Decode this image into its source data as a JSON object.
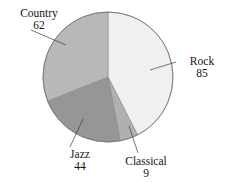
{
  "chart_data": {
    "type": "pie",
    "title": "",
    "categories": [
      "Rock",
      "Classical",
      "Jazz",
      "Country"
    ],
    "values": [
      85,
      9,
      44,
      62
    ],
    "total": 200,
    "start_angle_deg": 0,
    "direction": "clockwise",
    "legend": "none",
    "grid": false,
    "slices": [
      {
        "label": "Rock",
        "value": 85,
        "value_text": "85",
        "color": "#f0f0f0",
        "start_deg": 0.0,
        "end_deg": 153.0
      },
      {
        "label": "Classical",
        "value": 9,
        "value_text": "9",
        "color": "#b0b0b0",
        "start_deg": 153.0,
        "end_deg": 169.2
      },
      {
        "label": "Jazz",
        "value": 44,
        "value_text": "44",
        "color": "#969696",
        "start_deg": 169.2,
        "end_deg": 248.4
      },
      {
        "label": "Country",
        "value": 62,
        "value_text": "62",
        "color": "#b8b8b8",
        "start_deg": 248.4,
        "end_deg": 360.0
      }
    ],
    "colors": {
      "rock": "#f0f0f0",
      "classical": "#b0b0b0",
      "jazz": "#969696",
      "country": "#b8b8b8",
      "outline": "#6e6e6e",
      "leader_line": "#3c3c3c",
      "background": "#ffffff",
      "text": "#141414"
    },
    "geometry": {
      "cx": 108,
      "cy": 77,
      "r": 65
    }
  },
  "labels": {
    "country": {
      "name": "Country",
      "value": "62"
    },
    "rock": {
      "name": "Rock",
      "value": "85"
    },
    "jazz": {
      "name": "Jazz",
      "value": "44"
    },
    "classical": {
      "name": "Classical",
      "value": "9"
    }
  }
}
